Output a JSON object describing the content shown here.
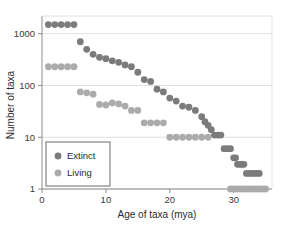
{
  "chart_data": {
    "type": "scatter",
    "title": "",
    "xlabel": "Age of taxa (mya)",
    "ylabel": "Number of  taxa",
    "xlim": [
      0,
      36
    ],
    "ylim": [
      1,
      2200
    ],
    "yscale": "log",
    "xticks": [
      0,
      10,
      20,
      30
    ],
    "xticklabels": [
      "0",
      "10",
      "20",
      "30"
    ],
    "yticks": [
      1,
      10,
      100,
      1000
    ],
    "yticklabels": [
      "1",
      "10",
      "100",
      "1000"
    ],
    "grid": "horizontal",
    "legend_position": "lower-left-inside",
    "series": [
      {
        "name": "Extinct",
        "color": "#7b7b7b",
        "points": [
          [
            1,
            1500
          ],
          [
            2,
            1500
          ],
          [
            3,
            1500
          ],
          [
            4,
            1500
          ],
          [
            5,
            1500
          ],
          [
            6,
            700
          ],
          [
            7,
            500
          ],
          [
            8,
            400
          ],
          [
            9,
            350
          ],
          [
            10,
            330
          ],
          [
            11,
            300
          ],
          [
            12,
            280
          ],
          [
            13,
            250
          ],
          [
            14,
            230
          ],
          [
            15,
            180
          ],
          [
            16,
            130
          ],
          [
            17,
            120
          ],
          [
            18,
            85
          ],
          [
            19,
            75
          ],
          [
            20,
            57
          ],
          [
            21,
            50
          ],
          [
            22,
            40
          ],
          [
            23,
            38
          ],
          [
            24,
            33
          ],
          [
            25,
            25
          ],
          [
            25.5,
            20
          ],
          [
            26,
            17
          ],
          [
            26.5,
            14
          ],
          [
            27,
            11
          ],
          [
            27.5,
            11
          ],
          [
            28,
            11
          ],
          [
            28.5,
            6
          ],
          [
            29,
            6
          ],
          [
            29.5,
            6
          ],
          [
            30,
            4
          ],
          [
            30.3,
            4
          ],
          [
            30.6,
            3
          ],
          [
            31,
            3
          ],
          [
            31.3,
            3
          ],
          [
            31.6,
            3
          ],
          [
            32,
            2
          ],
          [
            32.5,
            2
          ],
          [
            33,
            2
          ],
          [
            33.5,
            2
          ],
          [
            34,
            2
          ]
        ]
      },
      {
        "name": "Living",
        "color": "#ababab",
        "points": [
          [
            1,
            230
          ],
          [
            2,
            230
          ],
          [
            3,
            230
          ],
          [
            4,
            230
          ],
          [
            5,
            230
          ],
          [
            6,
            75
          ],
          [
            7,
            72
          ],
          [
            8,
            68
          ],
          [
            9,
            43
          ],
          [
            10,
            42
          ],
          [
            11,
            46
          ],
          [
            12,
            44
          ],
          [
            13,
            40
          ],
          [
            14,
            33
          ],
          [
            15,
            33
          ],
          [
            16,
            19
          ],
          [
            17,
            19
          ],
          [
            18,
            19
          ],
          [
            19,
            19
          ],
          [
            20,
            10
          ],
          [
            21,
            10
          ],
          [
            22,
            10
          ],
          [
            23,
            10
          ],
          [
            24,
            10
          ],
          [
            25,
            10
          ],
          [
            26,
            10
          ],
          [
            29.5,
            1
          ],
          [
            30,
            1
          ],
          [
            30.5,
            1
          ],
          [
            31,
            1
          ],
          [
            31.5,
            1
          ],
          [
            32,
            1
          ],
          [
            32.5,
            1
          ],
          [
            33,
            1
          ],
          [
            33.5,
            1
          ],
          [
            34,
            1
          ],
          [
            34.5,
            1
          ],
          [
            35,
            1
          ]
        ]
      }
    ],
    "legend_entries": [
      {
        "label": "Extinct",
        "color": "#7b7b7b"
      },
      {
        "label": "Living",
        "color": "#ababab"
      }
    ]
  }
}
